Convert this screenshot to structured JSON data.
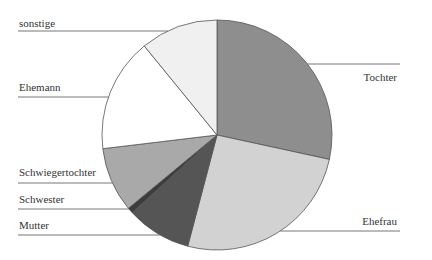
{
  "chart_data": {
    "type": "pie",
    "title": "",
    "start": "12 o'clock",
    "direction": "clockwise",
    "slices": [
      {
        "label": "Tochter",
        "value": 28.4,
        "color": "#8e8e8e",
        "label_side": "right"
      },
      {
        "label": "Ehefrau",
        "value": 25.7,
        "color": "#d2d2d2",
        "label_side": "right"
      },
      {
        "label": "Mutter",
        "value": 9.1,
        "color": "#555555",
        "label_side": "left"
      },
      {
        "label": "Schwester",
        "value": 0.8,
        "color": "#3c3c3c",
        "label_side": "left"
      },
      {
        "label": "Schwiegertochter",
        "value": 9.1,
        "color": "#a9a9a9",
        "label_side": "left"
      },
      {
        "label": "Ehemann",
        "value": 16.0,
        "color": "#ffffff",
        "label_side": "left"
      },
      {
        "label": "sonstige",
        "value": 10.9,
        "color": "#f0f0f0",
        "label_side": "left"
      }
    ],
    "legend": "none (leader-line labels)"
  }
}
